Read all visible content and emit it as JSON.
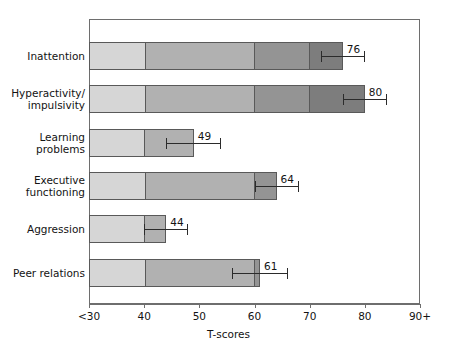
{
  "chart_data": {
    "type": "bar",
    "orientation": "horizontal",
    "title": "",
    "xlabel": "T-scores",
    "ylabel": "",
    "xlim": [
      30,
      90
    ],
    "grid": false,
    "legend": null,
    "x_tick_labels": [
      "<30",
      "40",
      "50",
      "60",
      "70",
      "80",
      "90+"
    ],
    "x_tick_values": [
      30,
      40,
      50,
      60,
      70,
      80,
      90
    ],
    "categories": [
      "Inattention",
      "Hyperactivity/\nimpulsivity",
      "Learning\nproblems",
      "Executive\nfunctioning",
      "Aggression",
      "Peer relations"
    ],
    "values": [
      76,
      80,
      49,
      64,
      44,
      61
    ],
    "value_labels": [
      "76",
      "80",
      "49",
      "64",
      "44",
      "61"
    ],
    "error_bars": [
      {
        "low": 72,
        "high": 80
      },
      {
        "low": 76,
        "high": 84
      },
      {
        "low": 44,
        "high": 54
      },
      {
        "low": 60,
        "high": 68
      },
      {
        "low": 40,
        "high": 48
      },
      {
        "low": 56,
        "high": 66
      }
    ],
    "shading_bands": [
      {
        "from": 30,
        "to": 40,
        "color": "#d6d6d6"
      },
      {
        "from": 40,
        "to": 60,
        "color": "#b1b1b1"
      },
      {
        "from": 60,
        "to": 70,
        "color": "#949494"
      },
      {
        "from": 70,
        "to": 90,
        "color": "#7d7d7d"
      }
    ],
    "colors": {
      "band_low": "#d6d6d6",
      "band_mid": "#b1b1b1",
      "band_high": "#949494",
      "band_very_high": "#7d7d7d",
      "bar_outline": "#595959",
      "axis": "#6e6e6e",
      "error_bar": "#2b2b2b",
      "text": "#131313",
      "background": "#ffffff"
    }
  }
}
